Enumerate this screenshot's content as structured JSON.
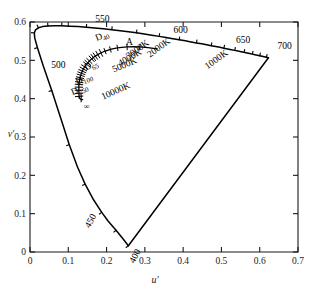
{
  "chart_data": {
    "type": "line",
    "title": "",
    "xlabel": "u′",
    "ylabel": "v′",
    "xlim": [
      0,
      0.7
    ],
    "ylim": [
      0,
      0.6
    ],
    "xticks": [
      "0",
      "0.1",
      "0.2",
      "0.3",
      "0.4",
      "0.5",
      "0.6",
      "0.7"
    ],
    "yticks": [
      "0",
      "0.1",
      "0.2",
      "0.3",
      "0.4",
      "0.5",
      "0.6"
    ],
    "grid": false,
    "legend": "none",
    "series": [
      {
        "name": "spectral-locus",
        "comment": "CIE 1976 UCS horseshoe, u' v' pairs from 400nm to 700nm",
        "points": [
          [
            0.2569,
            0.0165
          ],
          [
            0.2423,
            0.0353
          ],
          [
            0.2247,
            0.0566
          ],
          [
            0.2039,
            0.0808
          ],
          [
            0.1874,
            0.1033
          ],
          [
            0.1664,
            0.1356
          ],
          [
            0.144,
            0.1771
          ],
          [
            0.1241,
            0.2216
          ],
          [
            0.1026,
            0.28
          ],
          [
            0.0808,
            0.3478
          ],
          [
            0.0568,
            0.4212
          ],
          [
            0.0345,
            0.4858
          ],
          [
            0.0195,
            0.533
          ],
          [
            0.0123,
            0.5587
          ],
          [
            0.0113,
            0.5715
          ],
          [
            0.0145,
            0.5796
          ],
          [
            0.0219,
            0.5849
          ],
          [
            0.0326,
            0.588
          ],
          [
            0.0467,
            0.5897
          ],
          [
            0.0636,
            0.5902
          ],
          [
            0.083,
            0.59
          ],
          [
            0.1037,
            0.5892
          ],
          [
            0.1252,
            0.588
          ],
          [
            0.1473,
            0.5864
          ],
          [
            0.1693,
            0.5845
          ],
          [
            0.1915,
            0.5824
          ],
          [
            0.2137,
            0.58
          ],
          [
            0.2356,
            0.5774
          ],
          [
            0.257,
            0.5746
          ],
          [
            0.2781,
            0.5717
          ],
          [
            0.2984,
            0.5687
          ],
          [
            0.3183,
            0.5656
          ],
          [
            0.3374,
            0.5625
          ],
          [
            0.3557,
            0.5595
          ],
          [
            0.3731,
            0.5565
          ],
          [
            0.3897,
            0.5536
          ],
          [
            0.4055,
            0.5508
          ],
          [
            0.4206,
            0.5481
          ],
          [
            0.4348,
            0.5455
          ],
          [
            0.4484,
            0.543
          ],
          [
            0.4613,
            0.5406
          ],
          [
            0.4735,
            0.5383
          ],
          [
            0.4851,
            0.536
          ],
          [
            0.4961,
            0.5339
          ],
          [
            0.5065,
            0.5318
          ],
          [
            0.5164,
            0.5298
          ],
          [
            0.5258,
            0.5279
          ],
          [
            0.5348,
            0.526
          ],
          [
            0.5433,
            0.5243
          ],
          [
            0.5515,
            0.5225
          ],
          [
            0.5592,
            0.5209
          ],
          [
            0.5667,
            0.5193
          ],
          [
            0.5739,
            0.5177
          ],
          [
            0.5808,
            0.5162
          ],
          [
            0.5874,
            0.5147
          ],
          [
            0.5938,
            0.5133
          ],
          [
            0.6,
            0.5119
          ],
          [
            0.606,
            0.5105
          ],
          [
            0.6118,
            0.5092
          ],
          [
            0.6174,
            0.5078
          ],
          [
            0.6228,
            0.5066
          ]
        ]
      },
      {
        "name": "purple-line",
        "comment": "straight line closing the horseshoe, 400nm end to 700nm end",
        "points": [
          [
            0.2569,
            0.0165
          ],
          [
            0.6228,
            0.5066
          ]
        ]
      },
      {
        "name": "planckian-locus",
        "comment": "blackbody curve, u' v' from ~1500K up to infinite temperature",
        "points": [
          [
            0.3325,
            0.53
          ],
          [
            0.308,
            0.533
          ],
          [
            0.287,
            0.535
          ],
          [
            0.269,
            0.5355
          ],
          [
            0.2535,
            0.535
          ],
          [
            0.24,
            0.534
          ],
          [
            0.2285,
            0.5325
          ],
          [
            0.2185,
            0.5305
          ],
          [
            0.21,
            0.5285
          ],
          [
            0.2024,
            0.5262
          ],
          [
            0.196,
            0.524
          ],
          [
            0.1903,
            0.5217
          ],
          [
            0.1853,
            0.5194
          ],
          [
            0.181,
            0.5172
          ],
          [
            0.1771,
            0.515
          ],
          [
            0.1737,
            0.513
          ],
          [
            0.1706,
            0.511
          ],
          [
            0.1679,
            0.5091
          ],
          [
            0.1654,
            0.5073
          ],
          [
            0.1632,
            0.5056
          ],
          [
            0.1612,
            0.5039
          ],
          [
            0.158,
            0.5009
          ],
          [
            0.1552,
            0.4982
          ],
          [
            0.1529,
            0.4957
          ],
          [
            0.1509,
            0.4935
          ],
          [
            0.1492,
            0.4915
          ],
          [
            0.1477,
            0.4896
          ],
          [
            0.145,
            0.486
          ],
          [
            0.1428,
            0.4828
          ],
          [
            0.141,
            0.48
          ],
          [
            0.1395,
            0.4774
          ],
          [
            0.1382,
            0.4751
          ],
          [
            0.1366,
            0.4718
          ],
          [
            0.1354,
            0.4689
          ],
          [
            0.1344,
            0.4663
          ],
          [
            0.1335,
            0.464
          ],
          [
            0.1324,
            0.461
          ],
          [
            0.1314,
            0.4577
          ],
          [
            0.1307,
            0.4548
          ],
          [
            0.1301,
            0.4523
          ],
          [
            0.1296,
            0.45
          ],
          [
            0.129,
            0.4465
          ],
          [
            0.1285,
            0.443
          ],
          [
            0.1281,
            0.44
          ],
          [
            0.1279,
            0.437
          ],
          [
            0.1277,
            0.434
          ],
          [
            0.1276,
            0.43
          ],
          [
            0.1276,
            0.426
          ],
          [
            0.1276,
            0.422
          ],
          [
            0.1277,
            0.418
          ],
          [
            0.1278,
            0.414
          ],
          [
            0.128,
            0.41
          ],
          [
            0.1283,
            0.406
          ],
          [
            0.1286,
            0.402
          ]
        ]
      },
      {
        "name": "daylight-locus",
        "comment": "short tail below the Planckian locus ending at the infinity mark",
        "points": [
          [
            0.1286,
            0.402
          ],
          [
            0.132,
            0.3985
          ],
          [
            0.1375,
            0.3975
          ]
        ]
      }
    ],
    "wavelength_ticks": [
      {
        "label": "400",
        "u": 0.2569,
        "v": 0.0165
      },
      {
        "label": "450",
        "u": 0.1874,
        "v": 0.1033
      },
      {
        "label": "500",
        "u": 0.0345,
        "v": 0.4858
      },
      {
        "label": "550",
        "u": 0.1915,
        "v": 0.5824
      },
      {
        "label": "600",
        "u": 0.3981,
        "v": 0.5522
      },
      {
        "label": "650",
        "u": 0.5592,
        "v": 0.5209
      },
      {
        "label": "700",
        "u": 0.6228,
        "v": 0.5066
      }
    ],
    "temperature_labels": [
      {
        "label": "1000K",
        "u": 0.448,
        "v": 0.518
      },
      {
        "label": "2000K",
        "u": 0.308,
        "v": 0.533
      },
      {
        "label": "3000K",
        "u": 0.25,
        "v": 0.534
      },
      {
        "label": "4000K",
        "u": 0.225,
        "v": 0.531
      },
      {
        "label": "5000K",
        "u": 0.211,
        "v": 0.528
      },
      {
        "label": "10000K",
        "u": 0.18,
        "v": 0.47
      }
    ],
    "illuminant_labels": [
      {
        "label": "A",
        "sub": "",
        "u": 0.256,
        "v": 0.5243
      },
      {
        "label": "D",
        "sub": "40",
        "u": 0.216,
        "v": 0.532
      },
      {
        "label": "D",
        "sub": "65",
        "u": 0.1978,
        "v": 0.4683
      },
      {
        "label": "D",
        "sub": "100",
        "u": 0.1857,
        "v": 0.4442
      },
      {
        "label": "D",
        "sub": "250",
        "u": 0.179,
        "v": 0.43
      }
    ],
    "infinity_label": "∞"
  },
  "axes": {
    "x_label": "u′",
    "y_label": "v′",
    "x_tick_labels": [
      "0",
      "0.1",
      "0.2",
      "0.3",
      "0.4",
      "0.5",
      "0.6",
      "0.7"
    ],
    "y_tick_labels": [
      "0",
      "0.1",
      "0.2",
      "0.3",
      "0.4",
      "0.5",
      "0.6"
    ]
  },
  "colors": {
    "line": "#000000",
    "axis": "#1a1a1a",
    "background": "#ffffff"
  }
}
